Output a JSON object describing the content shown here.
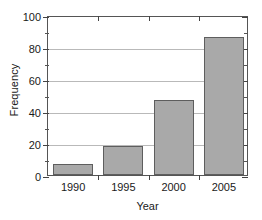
{
  "chart_data": {
    "type": "bar",
    "title": "",
    "xlabel": "Year",
    "ylabel": "Frequency",
    "categories": [
      "1990",
      "1995",
      "2000",
      "2005"
    ],
    "values": [
      7,
      18,
      47,
      86
    ],
    "ylim": [
      0,
      100
    ],
    "yticks": [
      0,
      20,
      40,
      60,
      80,
      100
    ],
    "ytick_labels": [
      "0",
      "20",
      "40",
      "60",
      "80",
      "100"
    ],
    "yminor_ticks": [
      10,
      30,
      50,
      70,
      90
    ],
    "grid": "horizontal-major",
    "legend": "none",
    "bar_fill_color": "#a9a9a9",
    "bar_edge_color": "#5e5e5e",
    "frame_color": "#555555",
    "gridline_color": "#b9b9b9"
  },
  "watermark": {
    "text": "Stat"
  }
}
